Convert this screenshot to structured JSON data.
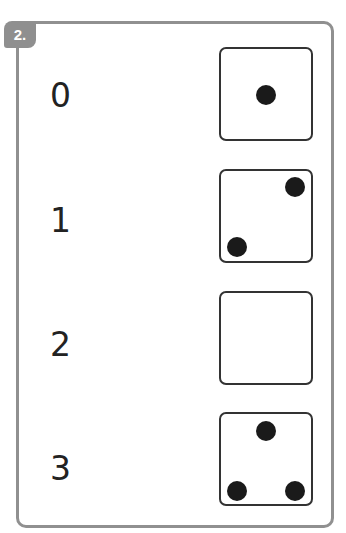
{
  "exercise": {
    "badge": "2.",
    "rows": [
      {
        "number": "0",
        "die_dots": 1
      },
      {
        "number": "1",
        "die_dots": 2
      },
      {
        "number": "2",
        "die_dots": 0
      },
      {
        "number": "3",
        "die_dots": 3
      }
    ]
  }
}
